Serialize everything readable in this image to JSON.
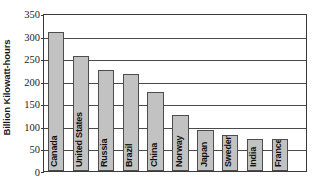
{
  "chart_data": {
    "type": "bar",
    "title": "",
    "xlabel": "",
    "ylabel": "Billion Kilowatt-hours",
    "ylim": [
      0,
      350
    ],
    "yticks": [
      0,
      50,
      100,
      150,
      200,
      250,
      300,
      350
    ],
    "ytick_labels": [
      "0",
      "50",
      "100",
      "150",
      "200",
      "250",
      "300",
      "350"
    ],
    "grid": true,
    "legend": "none",
    "bar_color": "#c2c2c2",
    "bar_edge_color": "#4d4d4d",
    "categories": [
      "Canada",
      "United States",
      "Russia",
      "Brazil",
      "China",
      "Norway",
      "Japan",
      "Sweden",
      "India",
      "France"
    ],
    "values": [
      308,
      254,
      224,
      215,
      174,
      124,
      90,
      79,
      70,
      70
    ]
  }
}
